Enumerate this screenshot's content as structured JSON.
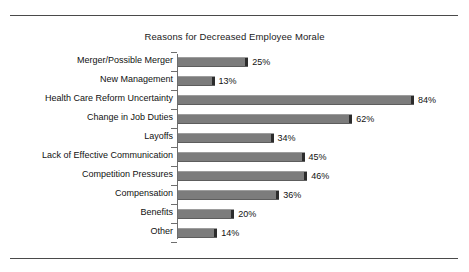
{
  "chart_data": {
    "type": "bar",
    "orientation": "horizontal",
    "title": "Reasons for Decreased Employee Morale",
    "xlabel": "",
    "ylabel": "",
    "xlim": [
      0,
      100
    ],
    "grid": false,
    "legend": null,
    "value_suffix": "%",
    "categories": [
      "Merger/Possible Merger",
      "New Management",
      "Health Care Reform Uncertainty",
      "Change in Job Duties",
      "Layoffs",
      "Lack of Effective Communication",
      "Competition Pressures",
      "Compensation",
      "Benefits",
      "Other"
    ],
    "values": [
      25,
      13,
      84,
      62,
      34,
      45,
      46,
      36,
      20,
      14
    ],
    "data_labels": [
      "25%",
      "13%",
      "84%",
      "62%",
      "34%",
      "45%",
      "46%",
      "36%",
      "20%",
      "14%"
    ],
    "colors": {
      "bar_fill": "#7c7c7c",
      "bar_highlight": "#9d9d9d",
      "bar_shadow": "#5d5d5d",
      "bar_endcap": "#2c2c2c",
      "axis": "#6e6e6e",
      "text": "#111111",
      "rule": "#4a4a4a",
      "background": "#ffffff"
    }
  }
}
